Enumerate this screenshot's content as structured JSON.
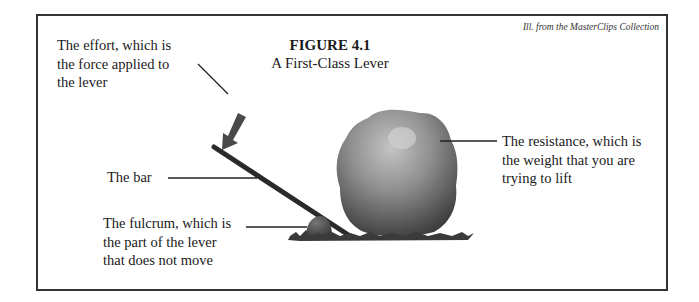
{
  "figure": {
    "number": "FIGURE 4.1",
    "title": "A First-Class Lever",
    "credit": "Ill. from the MasterClips Collection"
  },
  "labels": {
    "effort": [
      "The effort, which is",
      "the force applied to",
      "the lever"
    ],
    "bar": "The bar",
    "fulcrum": [
      "The fulcrum, which is",
      "the part of the lever",
      "that does not move"
    ],
    "resistance": [
      "The resistance, which is",
      "the weight that you are",
      "trying to lift"
    ]
  },
  "colors": {
    "border": "#333333",
    "text": "#1a1a1a",
    "arrow": "#4a4a4a",
    "bar": "#2a2a2a",
    "rock_light": "#b8b8b8",
    "rock_dark": "#3e3e3e",
    "fulcrum": "#555555",
    "grass": "#3a3a3a"
  }
}
